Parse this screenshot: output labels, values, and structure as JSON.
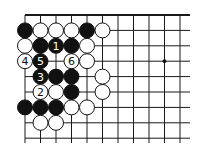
{
  "diagram": {
    "type": "go-board-fragment",
    "grid": {
      "columns": 11,
      "rows": 9,
      "origin_x": 25,
      "origin_y": 15,
      "spacing_x": 15.5,
      "spacing_y": 15.4,
      "right_extent_x": 190,
      "bottom_extent_y": 143,
      "top_edge_is_board_border": true
    },
    "colors": {
      "line": "#1a1a1a",
      "black_stone": "#111111",
      "white_stone": "#ffffff",
      "background": "#ffffff"
    },
    "star_points": [
      {
        "col": 9,
        "row": 3
      }
    ],
    "stones": [
      {
        "col": 0,
        "row": 1,
        "color": "black",
        "label": ""
      },
      {
        "col": 1,
        "row": 1,
        "color": "white",
        "label": ""
      },
      {
        "col": 2,
        "row": 1,
        "color": "white",
        "label": ""
      },
      {
        "col": 3,
        "row": 1,
        "color": "white",
        "label": ""
      },
      {
        "col": 4,
        "row": 1,
        "color": "black",
        "label": ""
      },
      {
        "col": 5,
        "row": 1,
        "color": "white",
        "label": ""
      },
      {
        "col": 0,
        "row": 2,
        "color": "white",
        "label": ""
      },
      {
        "col": 1,
        "row": 2,
        "color": "black",
        "label": ""
      },
      {
        "col": 2,
        "row": 2,
        "color": "black",
        "label": "1"
      },
      {
        "col": 3,
        "row": 2,
        "color": "black",
        "label": ""
      },
      {
        "col": 4,
        "row": 2,
        "color": "white",
        "label": ""
      },
      {
        "col": 0,
        "row": 3,
        "color": "white",
        "label": "4"
      },
      {
        "col": 1,
        "row": 3,
        "color": "black",
        "label": "5"
      },
      {
        "col": 3,
        "row": 3,
        "color": "white",
        "label": "6"
      },
      {
        "col": 4,
        "row": 3,
        "color": "white",
        "label": ""
      },
      {
        "col": 1,
        "row": 4,
        "color": "black",
        "label": "3"
      },
      {
        "col": 2,
        "row": 4,
        "color": "black",
        "label": ""
      },
      {
        "col": 3,
        "row": 4,
        "color": "black",
        "label": ""
      },
      {
        "col": 5,
        "row": 4,
        "color": "white",
        "label": ""
      },
      {
        "col": 1,
        "row": 5,
        "color": "white",
        "label": "2"
      },
      {
        "col": 2,
        "row": 5,
        "color": "white",
        "label": ""
      },
      {
        "col": 3,
        "row": 5,
        "color": "black",
        "label": ""
      },
      {
        "col": 5,
        "row": 5,
        "color": "white",
        "label": ""
      },
      {
        "col": 0,
        "row": 6,
        "color": "black",
        "label": ""
      },
      {
        "col": 1,
        "row": 6,
        "color": "black",
        "label": ""
      },
      {
        "col": 2,
        "row": 6,
        "color": "black",
        "label": ""
      },
      {
        "col": 3,
        "row": 6,
        "color": "white",
        "label": ""
      },
      {
        "col": 4,
        "row": 6,
        "color": "white",
        "label": ""
      },
      {
        "col": 1,
        "row": 7,
        "color": "white",
        "label": ""
      },
      {
        "col": 2,
        "row": 7,
        "color": "white",
        "label": ""
      }
    ],
    "move_sequence": [
      {
        "move": 1,
        "color": "black",
        "col": 2,
        "row": 2
      },
      {
        "move": 2,
        "color": "white",
        "col": 1,
        "row": 5
      },
      {
        "move": 3,
        "color": "black",
        "col": 1,
        "row": 4
      },
      {
        "move": 4,
        "color": "white",
        "col": 0,
        "row": 3
      },
      {
        "move": 5,
        "color": "black",
        "col": 1,
        "row": 3
      },
      {
        "move": 6,
        "color": "white",
        "col": 3,
        "row": 3
      }
    ]
  }
}
